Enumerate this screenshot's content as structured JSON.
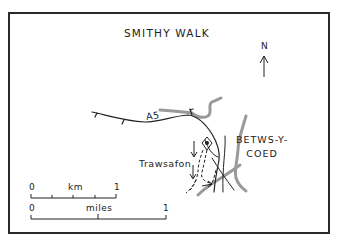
{
  "map": {
    "title": "SMITHY WALK",
    "north_label": "N",
    "road_label": "A5",
    "town_label_line1": "BETWS-Y-",
    "town_label_line2": "COED",
    "place_label": "Trawsafon",
    "colors": {
      "ink": "#222222",
      "river": "#9a9a9a",
      "border": "#2a2a2a",
      "background": "#ffffff"
    }
  },
  "scale_bars": {
    "km": {
      "start": "0",
      "unit": "km",
      "end": "1"
    },
    "miles": {
      "start": "0",
      "unit": "miles",
      "end": "1"
    }
  }
}
